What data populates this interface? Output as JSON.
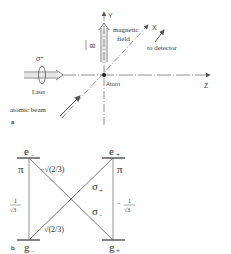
{
  "panel_a": {
    "label": "a",
    "axes": {
      "y": "Y",
      "x": "X",
      "z": "Z"
    },
    "field_vector": "B",
    "field_label_line1": "magnetic",
    "field_label_line2": "field",
    "detector_label": "to detector",
    "laser_polarization": "σ⁺",
    "laser_label": "Laser",
    "atom_label": "Atom",
    "beam_label": "atomic beam"
  },
  "panel_b": {
    "label": "b",
    "levels": {
      "e_minus": "e",
      "e_minus_sub": "−",
      "e_plus": "e",
      "e_plus_sub": "+",
      "g_minus": "g",
      "g_minus_sub": "−",
      "g_plus": "g",
      "g_plus_sub": "+"
    },
    "transitions": {
      "pi_left": "π",
      "pi_right": "π",
      "sigma_plus": "σ",
      "sigma_plus_sub": "+",
      "sigma_minus": "σ",
      "sigma_minus_sub": "−"
    },
    "coefficients": {
      "upper_cross": "−√(2/3)",
      "lower_cross": "√(2/3)",
      "left_vertical_num": "1",
      "left_vertical_den": "√3",
      "right_vertical_sign": "−",
      "right_vertical_num": "1",
      "right_vertical_den": "√3"
    }
  }
}
